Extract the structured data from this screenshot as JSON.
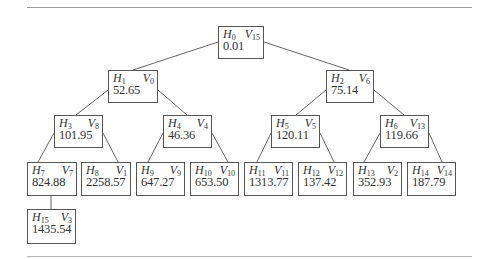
{
  "diagram": {
    "type": "binary-tree",
    "nodes": [
      {
        "id": "n0",
        "h": "0",
        "v": "15",
        "value": "0.01",
        "parent": null
      },
      {
        "id": "n1",
        "h": "1",
        "v": "0",
        "value": "52.65",
        "parent": "n0"
      },
      {
        "id": "n2",
        "h": "2",
        "v": "6",
        "value": "75.14",
        "parent": "n0"
      },
      {
        "id": "n3",
        "h": "3",
        "v": "8",
        "value": "101.95",
        "parent": "n1"
      },
      {
        "id": "n4",
        "h": "4",
        "v": "4",
        "value": "46.36",
        "parent": "n1"
      },
      {
        "id": "n5",
        "h": "5",
        "v": "5",
        "value": "120.11",
        "parent": "n2"
      },
      {
        "id": "n6",
        "h": "6",
        "v": "13",
        "value": "119.66",
        "parent": "n2"
      },
      {
        "id": "n7",
        "h": "7",
        "v": "7",
        "value": "824.88",
        "parent": "n3"
      },
      {
        "id": "n8",
        "h": "8",
        "v": "1",
        "value": "2258.57",
        "parent": "n3"
      },
      {
        "id": "n9",
        "h": "9",
        "v": "9",
        "value": "647.27",
        "parent": "n4"
      },
      {
        "id": "n10",
        "h": "10",
        "v": "10",
        "value": "653.50",
        "parent": "n4"
      },
      {
        "id": "n11",
        "h": "11",
        "v": "11",
        "value": "1313.77",
        "parent": "n5"
      },
      {
        "id": "n12",
        "h": "12",
        "v": "12",
        "value": "137.42",
        "parent": "n5"
      },
      {
        "id": "n13",
        "h": "13",
        "v": "2",
        "value": "352.93",
        "parent": "n6"
      },
      {
        "id": "n14",
        "h": "14",
        "v": "14",
        "value": "187.79",
        "parent": "n6"
      },
      {
        "id": "n15",
        "h": "15",
        "v": "3",
        "value": "1435.54",
        "parent": "n7"
      }
    ],
    "label_prefix_h": "H",
    "label_prefix_v": "V",
    "line_color": "#555555",
    "border_color": "#555555"
  }
}
